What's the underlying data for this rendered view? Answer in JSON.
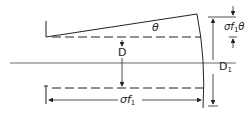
{
  "diagram": {
    "labels": {
      "theta": "θ",
      "D": "D",
      "D1_main": "D",
      "D1_sub": "1",
      "sigma_f1_theta_sigma": "σ",
      "sigma_f1_theta_f": "f",
      "sigma_f1_theta_sub": "1",
      "sigma_f1_theta_theta": "θ",
      "sigma_f1_sigma": "σ",
      "sigma_f1_f": "f",
      "sigma_f1_sub": "1"
    },
    "colors": {
      "stroke": "#222222",
      "background": "#ffffff"
    }
  }
}
